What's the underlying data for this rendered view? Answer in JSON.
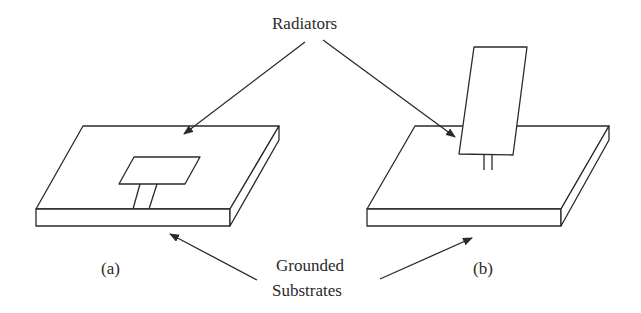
{
  "labels": {
    "radiators": "Radiators",
    "grounded_line1": "Grounded",
    "grounded_line2": "Substrates",
    "fig_a": "(a)",
    "fig_b": "(b)"
  },
  "colors": {
    "stroke": "#2a2a2a",
    "background": "#ffffff"
  }
}
